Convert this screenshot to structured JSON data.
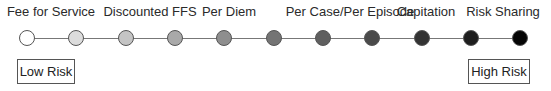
{
  "diagram": {
    "labels": [
      {
        "text": "Fee for Service",
        "x": 51
      },
      {
        "text": "Discounted FFS",
        "x": 150
      },
      {
        "text": "Per Diem",
        "x": 229
      },
      {
        "text": "Per Case/Per Episode",
        "x": 350
      },
      {
        "text": "Capitation",
        "x": 426
      },
      {
        "text": "Risk Sharing",
        "x": 503
      }
    ],
    "nodes": [
      {
        "x": 27,
        "color": "#ffffff"
      },
      {
        "x": 76,
        "color": "#dcdcdc"
      },
      {
        "x": 126,
        "color": "#c4c4c4"
      },
      {
        "x": 175,
        "color": "#a9a9a9"
      },
      {
        "x": 224,
        "color": "#8e8e8e"
      },
      {
        "x": 274,
        "color": "#747474"
      },
      {
        "x": 323,
        "color": "#5f5f5f"
      },
      {
        "x": 372,
        "color": "#4a4a4a"
      },
      {
        "x": 422,
        "color": "#333333"
      },
      {
        "x": 471,
        "color": "#1e1e1e"
      },
      {
        "x": 520,
        "color": "#050505"
      }
    ],
    "low_risk": "Low Risk",
    "high_risk": "High Risk"
  }
}
